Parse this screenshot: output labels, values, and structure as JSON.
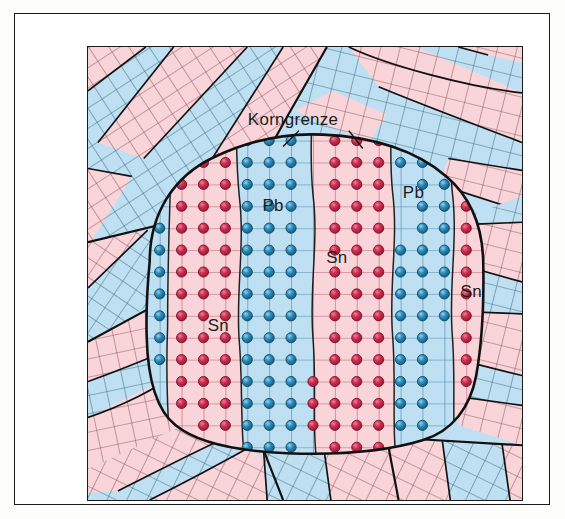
{
  "figure": {
    "title_visible": false,
    "caption": "",
    "type": "microstructure-diagram",
    "language": "de"
  },
  "colors": {
    "pink_fill": "#f9d5da",
    "pink_line": "#b8626f",
    "blue_fill": "#bfe0f2",
    "blue_line": "#4f88a8",
    "red_dot": "#c62a4c",
    "red_dot_dark": "#8d1830",
    "red_dot_hi": "#ef8ba0",
    "blue_dot": "#2a87ba",
    "blue_dot_dark": "#13566f",
    "blue_dot_hi": "#8ed2ef",
    "outline": "#111111",
    "text": "#1c1c1c",
    "page_bg": "#ffffff",
    "frame": "#1a1a1a"
  },
  "labels": {
    "grain_boundary": "Korngrenze",
    "lead": "Pb",
    "tin": "Sn"
  },
  "annotations": [
    {
      "id": "korngrenze",
      "text": "Korngrenze",
      "x": 206,
      "y": 78,
      "size": "big",
      "leaders": 2
    },
    {
      "id": "pb-left",
      "text": "Pb",
      "x": 186,
      "y": 165,
      "size": "big"
    },
    {
      "id": "pb-right",
      "text": "Pb",
      "x": 327,
      "y": 152,
      "size": "big"
    },
    {
      "id": "sn-center",
      "text": "Sn",
      "x": 250,
      "y": 217,
      "size": "big"
    },
    {
      "id": "sn-right",
      "text": "Sn",
      "x": 385,
      "y": 251,
      "size": "big"
    },
    {
      "id": "sn-left",
      "text": "Sn",
      "x": 131,
      "y": 285,
      "size": "big"
    }
  ],
  "legend_note": "",
  "lamellae": [
    {
      "index": 0,
      "phase": "Pb",
      "color": "blue",
      "columns": 1
    },
    {
      "index": 1,
      "phase": "Sn",
      "color": "pink",
      "columns": 3
    },
    {
      "index": 2,
      "phase": "Pb",
      "color": "blue",
      "columns": 3
    },
    {
      "index": 3,
      "phase": "Sn",
      "color": "pink",
      "columns": 4
    },
    {
      "index": 4,
      "phase": "Pb",
      "color": "blue",
      "columns": 3
    },
    {
      "index": 5,
      "phase": "Sn",
      "color": "pink",
      "columns": 2
    }
  ],
  "surrounding_grains": [
    {
      "id": "grain-top-left",
      "orientation_deg": -33
    },
    {
      "id": "grain-top-right",
      "orientation_deg": 14
    },
    {
      "id": "grain-left",
      "orientation_deg": -52
    },
    {
      "id": "grain-left-lower",
      "orientation_deg": -18
    },
    {
      "id": "grain-right",
      "orientation_deg": 8
    },
    {
      "id": "grain-bottom-left",
      "orientation_deg": 26
    },
    {
      "id": "grain-bottom-mid",
      "orientation_deg": -8
    },
    {
      "id": "grain-bottom-right",
      "orientation_deg": 22
    }
  ]
}
